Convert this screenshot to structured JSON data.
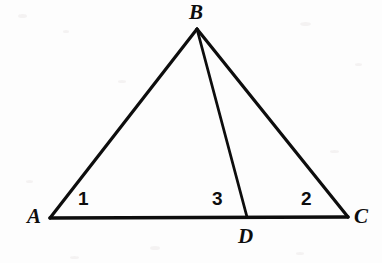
{
  "figure": {
    "kind": "geometry-diagram",
    "background_color": "#fdfdfd",
    "stroke_color": "#0d0d0d",
    "canvas": {
      "width": 382,
      "height": 263
    }
  },
  "points": [
    {
      "id": "A",
      "label": "A",
      "x": 50,
      "y": 218,
      "label_x": 27,
      "label_y": 206
    },
    {
      "id": "B",
      "label": "B",
      "x": 197,
      "y": 29,
      "label_x": 189,
      "label_y": 2
    },
    {
      "id": "C",
      "label": "C",
      "x": 348,
      "y": 217,
      "label_x": 354,
      "label_y": 206
    },
    {
      "id": "D",
      "label": "D",
      "x": 247,
      "y": 217,
      "label_x": 238,
      "label_y": 226
    }
  ],
  "segments": [
    {
      "id": "AB",
      "from": "A",
      "to": "B",
      "x1": 50,
      "y1": 218,
      "x2": 197,
      "y2": 29,
      "width": 3.2
    },
    {
      "id": "BC",
      "from": "B",
      "to": "C",
      "x1": 197,
      "y1": 29,
      "x2": 348,
      "y2": 217,
      "width": 3.2
    },
    {
      "id": "AC",
      "from": "A",
      "to": "C",
      "x1": 50,
      "y1": 218,
      "x2": 348,
      "y2": 217,
      "width": 3.6
    },
    {
      "id": "BD",
      "from": "B",
      "to": "D",
      "x1": 197,
      "y1": 29,
      "x2": 247,
      "y2": 217,
      "width": 2.8
    }
  ],
  "angle_labels": [
    {
      "id": "angle-1",
      "label": "1",
      "at_vertex": "A",
      "x": 78,
      "y": 189
    },
    {
      "id": "angle-3",
      "label": "3",
      "at_vertex": "D",
      "x": 212,
      "y": 189
    },
    {
      "id": "angle-2",
      "label": "2",
      "at_vertex": "C",
      "x": 301,
      "y": 189
    }
  ],
  "chart_data": {
    "type": "diagram",
    "title": "",
    "shape": "triangle-with-cevian",
    "vertices": {
      "A": [
        50,
        218
      ],
      "B": [
        197,
        29
      ],
      "C": [
        348,
        217
      ],
      "D": [
        247,
        217
      ]
    },
    "edges": [
      [
        "A",
        "B"
      ],
      [
        "B",
        "C"
      ],
      [
        "A",
        "C"
      ],
      [
        "B",
        "D"
      ]
    ],
    "marked_angles": [
      {
        "number": "1",
        "vertex": "A",
        "between": [
          "AB",
          "AC"
        ]
      },
      {
        "number": "3",
        "vertex": "D",
        "between": [
          "DB",
          "DA"
        ]
      },
      {
        "number": "2",
        "vertex": "C",
        "between": [
          "CB",
          "CA"
        ]
      }
    ]
  }
}
